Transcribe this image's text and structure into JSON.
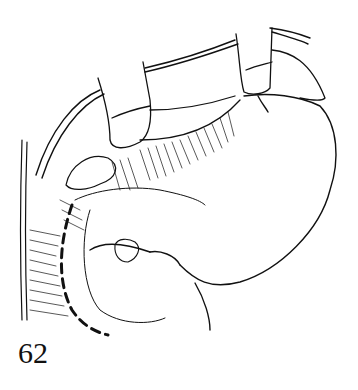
{
  "figure": {
    "ink_color": "#111111",
    "background": "#ffffff"
  },
  "page_number": "62"
}
